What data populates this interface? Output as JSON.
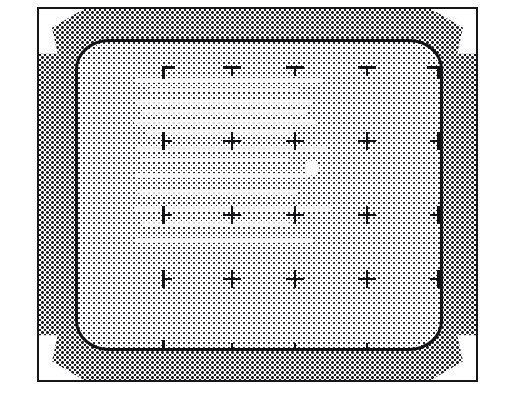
{
  "figure": {
    "monitor_frame": {
      "x": 37,
      "y": 7,
      "width": 441,
      "height": 375
    },
    "screen": {
      "x": 36,
      "y": 30,
      "width": 368,
      "height": 312
    }
  },
  "colors": {
    "page_background": "#ffffff",
    "frame_border": "#17171a",
    "bezel_halftone_dot": "#1a1a1d",
    "bezel_flare": "#ffffff",
    "screen_border": "#121214",
    "screen_halftone_dot": "#2a2a2e",
    "mark_stroke": "#111114",
    "cursor_spot": "#ffffff"
  },
  "pattern": {
    "columns": 5,
    "rows": 5,
    "column_x": [
      92,
      154,
      217,
      289,
      354
    ],
    "row_y": [
      32,
      99,
      173,
      237,
      303
    ],
    "marks": [
      {
        "name": "corner-top-left",
        "glyph": "corner-tl",
        "col": 0,
        "row": 0
      },
      {
        "name": "edge-top-1",
        "glyph": "tee-down",
        "col": 1,
        "row": 0
      },
      {
        "name": "edge-top-2",
        "glyph": "tee-down",
        "col": 2,
        "row": 0
      },
      {
        "name": "edge-top-3",
        "glyph": "tee-down",
        "col": 3,
        "row": 0
      },
      {
        "name": "corner-top-right",
        "glyph": "corner-tr",
        "col": 4,
        "row": 0
      },
      {
        "name": "edge-left-1",
        "glyph": "tee-right",
        "col": 0,
        "row": 1
      },
      {
        "name": "cross-r1-c1",
        "glyph": "cross",
        "col": 1,
        "row": 1
      },
      {
        "name": "cross-r1-c2",
        "glyph": "cross",
        "col": 2,
        "row": 1
      },
      {
        "name": "cross-r1-c3",
        "glyph": "cross",
        "col": 3,
        "row": 1
      },
      {
        "name": "edge-right-1",
        "glyph": "tee-left",
        "col": 4,
        "row": 1
      },
      {
        "name": "edge-left-2",
        "glyph": "tee-right",
        "col": 0,
        "row": 2
      },
      {
        "name": "cross-r2-c1",
        "glyph": "cross",
        "col": 1,
        "row": 2
      },
      {
        "name": "cross-r2-c2",
        "glyph": "cross",
        "col": 2,
        "row": 2
      },
      {
        "name": "cross-r2-c3",
        "glyph": "cross",
        "col": 3,
        "row": 2
      },
      {
        "name": "edge-right-2",
        "glyph": "tee-left",
        "col": 4,
        "row": 2
      },
      {
        "name": "edge-left-3",
        "glyph": "tee-right",
        "col": 0,
        "row": 3
      },
      {
        "name": "cross-r3-c1",
        "glyph": "cross",
        "col": 1,
        "row": 3
      },
      {
        "name": "cross-r3-c2",
        "glyph": "cross",
        "col": 2,
        "row": 3
      },
      {
        "name": "cross-r3-c3",
        "glyph": "cross",
        "col": 3,
        "row": 3
      },
      {
        "name": "edge-right-3",
        "glyph": "tee-left",
        "col": 4,
        "row": 3
      },
      {
        "name": "corner-bottom-left",
        "glyph": "corner-bl",
        "col": 0,
        "row": 4
      },
      {
        "name": "edge-bottom-1",
        "glyph": "tee-up",
        "col": 1,
        "row": 4
      },
      {
        "name": "edge-bottom-2",
        "glyph": "tee-up",
        "col": 2,
        "row": 4
      },
      {
        "name": "edge-bottom-3",
        "glyph": "tee-up",
        "col": 3,
        "row": 4
      },
      {
        "name": "corner-bottom-right",
        "glyph": "corner-br",
        "col": 4,
        "row": 4
      }
    ]
  },
  "cursor": {
    "x": 234,
    "y": 126,
    "diameter": 15
  },
  "streaks": [
    {
      "x": 56,
      "y": 36,
      "w": 188,
      "h": 5
    },
    {
      "x": 70,
      "y": 46,
      "w": 152,
      "h": 4
    },
    {
      "x": 58,
      "y": 57,
      "w": 176,
      "h": 5
    },
    {
      "x": 64,
      "y": 68,
      "w": 166,
      "h": 4
    },
    {
      "x": 56,
      "y": 78,
      "w": 182,
      "h": 5
    },
    {
      "x": 68,
      "y": 88,
      "w": 148,
      "h": 4
    },
    {
      "x": 58,
      "y": 104,
      "w": 192,
      "h": 5
    },
    {
      "x": 62,
      "y": 116,
      "w": 150,
      "h": 4
    },
    {
      "x": 56,
      "y": 131,
      "w": 176,
      "h": 5
    },
    {
      "x": 60,
      "y": 148,
      "w": 160,
      "h": 4
    },
    {
      "x": 56,
      "y": 164,
      "w": 196,
      "h": 5
    },
    {
      "x": 64,
      "y": 180,
      "w": 148,
      "h": 4
    },
    {
      "x": 56,
      "y": 196,
      "w": 180,
      "h": 5
    }
  ]
}
